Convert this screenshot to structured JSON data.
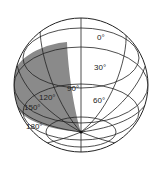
{
  "diagram": {
    "type": "sphere-latitude-longitude",
    "shaded_color": "#8a8a8a",
    "line_color": "#222222",
    "labels": [
      {
        "text": "0°",
        "x": 97,
        "y": 34
      },
      {
        "text": "30°",
        "x": 94,
        "y": 64
      },
      {
        "text": "60°",
        "x": 93,
        "y": 97
      },
      {
        "text": "90°",
        "x": 67,
        "y": 85
      },
      {
        "text": "120°",
        "x": 39,
        "y": 94
      },
      {
        "text": "150°",
        "x": 24,
        "y": 104
      },
      {
        "text": "180°",
        "x": 26,
        "y": 123
      }
    ]
  }
}
